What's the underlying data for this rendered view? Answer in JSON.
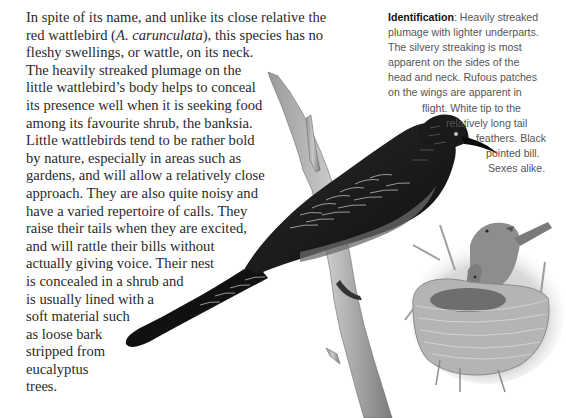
{
  "main_text": {
    "lines": [
      "In spite of its name, and unlike its close relative the",
      "red wattlebird (",
      "A. carunculata",
      "), this species has no",
      "fleshy swellings, or wattle, on its neck.",
      "The heavily streaked plumage on the",
      "little wattlebird’s body helps to conceal",
      "its presence well when it is seeking food",
      "among its favourite shrub, the banksia.",
      "Little wattlebirds tend to be rather bold",
      "by nature, especially in areas such as",
      "gardens, and will allow a relatively close",
      "approach. They are also quite noisy and",
      "have a varied repertoire of calls. They",
      "raise their tails when they are excited,",
      "and will rattle their bills without",
      "actually giving voice. Their nest",
      "is concealed in a shrub and",
      "is usually lined with a",
      "soft material such",
      "as loose bark",
      "stripped from",
      "eucalyptus",
      "trees."
    ]
  },
  "identification": {
    "label": "Identification",
    "lines": [
      ": Heavily streaked",
      "plumage with lighter underparts.",
      "The silvery streaking is most",
      "apparent on the sides of the",
      "head and neck. Rufous patches",
      "on the wings are apparent in",
      "flight. White tip to the",
      "relatively long tail",
      "feathers. Black",
      "pointed bill.",
      "Sexes alike."
    ]
  },
  "illustrations": {
    "main_bird": "little-wattlebird-perched-on-branch",
    "nest_scene": "wattlebird-feeding-chicks-in-nest"
  },
  "colors": {
    "body_text": "#2a2a2a",
    "caption_text": "#555555",
    "bird_dark": "#151515"
  }
}
